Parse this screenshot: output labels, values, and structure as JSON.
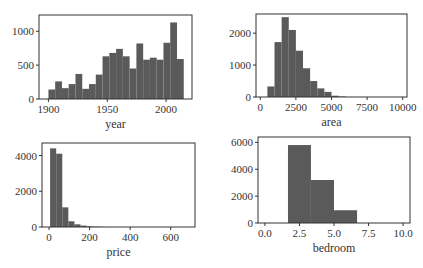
{
  "figure": {
    "width": 423,
    "height": 268,
    "background": "#ffffff",
    "bar_color": "#5a5a5a",
    "frame_color": "#333333"
  },
  "chart_data": [
    {
      "id": "year",
      "type": "bar",
      "subtype": "histogram",
      "title": "",
      "xlabel": "year",
      "ylabel": "",
      "xlim": [
        1892,
        2022
      ],
      "ylim": [
        0,
        1240
      ],
      "xticks": [
        1900,
        1950,
        2000
      ],
      "xtick_labels": [
        "1900",
        "1950",
        "2000"
      ],
      "yticks": [
        0,
        500,
        1000
      ],
      "ytick_labels": [
        "0",
        "500",
        "1000"
      ],
      "bin_edges": [
        1900,
        1905.75,
        1911.5,
        1917.25,
        1923,
        1928.75,
        1934.5,
        1940.25,
        1946,
        1951.75,
        1957.5,
        1963.25,
        1969,
        1974.75,
        1980.5,
        1986.25,
        1992,
        1997.75,
        2003.5,
        2009.25,
        2015
      ],
      "values": [
        140,
        260,
        160,
        220,
        370,
        150,
        220,
        360,
        630,
        680,
        740,
        630,
        450,
        820,
        580,
        610,
        580,
        830,
        1130,
        590
      ],
      "grid": false,
      "frame": {
        "x": 39,
        "y": 15,
        "w": 153,
        "h": 84
      }
    },
    {
      "id": "area",
      "type": "bar",
      "subtype": "histogram",
      "title": "",
      "xlabel": "area",
      "ylabel": "",
      "xlim": [
        -300,
        10300
      ],
      "ylim": [
        0,
        2600
      ],
      "xticks": [
        0,
        2500,
        5000,
        7500,
        10000
      ],
      "xtick_labels": [
        "0",
        "2500",
        "5000",
        "7500",
        "10000"
      ],
      "yticks": [
        0,
        1000,
        2000
      ],
      "ytick_labels": [
        "0",
        "1000",
        "2000"
      ],
      "bin_edges": [
        500,
        1000,
        1500,
        2000,
        2500,
        3000,
        3500,
        4000,
        4500,
        5000,
        5500,
        6000
      ],
      "values": [
        330,
        1720,
        2500,
        2100,
        1450,
        900,
        500,
        270,
        160,
        40,
        15
      ],
      "grid": false,
      "frame": {
        "x": 256,
        "y": 14,
        "w": 151,
        "h": 83
      }
    },
    {
      "id": "price",
      "type": "bar",
      "subtype": "histogram",
      "title": "",
      "xlabel": "price",
      "ylabel": "",
      "xlim": [
        -35,
        720
      ],
      "ylim": [
        0,
        4700
      ],
      "xticks": [
        0,
        200,
        400,
        600
      ],
      "xtick_labels": [
        "0",
        "200",
        "400",
        "600"
      ],
      "yticks": [
        0,
        2000,
        4000
      ],
      "ytick_labels": [
        "0",
        "2000",
        "4000"
      ],
      "bin_edges": [
        5,
        35,
        65,
        95,
        125,
        155,
        185,
        215,
        245,
        275
      ],
      "values": [
        4400,
        4100,
        1100,
        320,
        150,
        80,
        40,
        20,
        10
      ],
      "grid": false,
      "frame": {
        "x": 42,
        "y": 143,
        "w": 153,
        "h": 84
      }
    },
    {
      "id": "bedroom",
      "type": "bar",
      "subtype": "histogram",
      "title": "",
      "xlabel": "bedroom",
      "ylabel": "",
      "xlim": [
        -0.5,
        10.5
      ],
      "ylim": [
        0,
        6400
      ],
      "xticks": [
        0,
        2.5,
        5,
        7.5,
        10
      ],
      "xtick_labels": [
        "0.0",
        "2.5",
        "5.0",
        "7.5",
        "10.0"
      ],
      "yticks": [
        0,
        2000,
        4000,
        6000
      ],
      "ytick_labels": [
        "0",
        "2000",
        "4000",
        "6000"
      ],
      "bin_edges": [
        1.67,
        3.33,
        5.0,
        6.67
      ],
      "values": [
        5800,
        3200,
        950
      ],
      "grid": false,
      "frame": {
        "x": 258,
        "y": 137,
        "w": 152,
        "h": 86
      }
    }
  ]
}
